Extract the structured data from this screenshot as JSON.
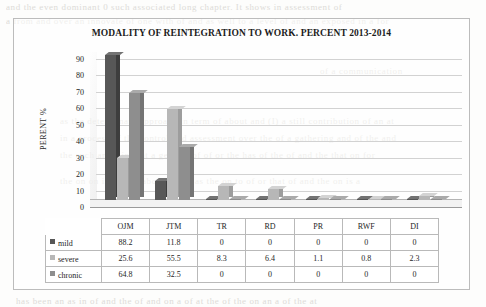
{
  "figure": {
    "title": "MODALITY OF REINTEGRATION TO WORK. PERCENT 2013-2014"
  },
  "colors": {
    "mild": "#575757",
    "severe": "#b7b7b7",
    "chronic": "#8e8e8e",
    "grid": "#d2d2d2",
    "axis": "#9a9a9a",
    "text": "#1e1e1e",
    "frame": "#bcbcbc"
  },
  "chart_data": {
    "type": "bar",
    "title": "MODALITY OF REINTEGRATION TO WORK. PERCENT 2013-2014",
    "xlabel": "",
    "ylabel": "PERENT %",
    "ylim": [
      0,
      90
    ],
    "yticks": [
      90,
      80,
      70,
      60,
      50,
      40,
      30,
      20,
      10,
      0
    ],
    "grid": true,
    "legend": "table",
    "categories": [
      "OJM",
      "JTM",
      "TR",
      "RD",
      "PR",
      "RWF",
      "DI"
    ],
    "series": [
      {
        "name": "mild",
        "values": [
          88.2,
          11.8,
          0,
          0,
          0,
          0,
          0
        ]
      },
      {
        "name": "severe",
        "values": [
          25.6,
          55.5,
          8.3,
          6.4,
          1.1,
          0.8,
          2.3
        ]
      },
      {
        "name": "chronic",
        "values": [
          64.8,
          32.5,
          0,
          0,
          0,
          0,
          0
        ]
      }
    ]
  },
  "table": {
    "header": [
      "",
      "OJM",
      "JTM",
      "TR",
      "RD",
      "PR",
      "RWF",
      "DI"
    ],
    "rows": [
      {
        "label": "mild",
        "cells": [
          "88.2",
          "11.8",
          "0",
          "0",
          "0",
          "0",
          "0"
        ]
      },
      {
        "label": "severe",
        "cells": [
          "25.6",
          "55.5",
          "8.3",
          "6.4",
          "1.1",
          "0.8",
          "2.3"
        ]
      },
      {
        "label": "chronic",
        "cells": [
          "64.8",
          "32.5",
          "0",
          "0",
          "0",
          "0",
          "0"
        ]
      }
    ]
  },
  "background_ghost_text": [
    "and the even dominant 0 such associated long chapter. It shows in assessment of",
    "a from and over an innovate of one with of and as well to a level of and an exposed in a for",
    "of a communication",
    "as the determinant approach in term of about and (I) a still contribution of an at",
    "in a process of the control and assessment over the of a gathering and of the and",
    "the such an as in that a general of of or the has of the of and the that on for",
    "the on on in and of about of the as the on to of or that of and the on is a",
    "has been an as in of and the of and on a of at the of the on an a of the at"
  ]
}
